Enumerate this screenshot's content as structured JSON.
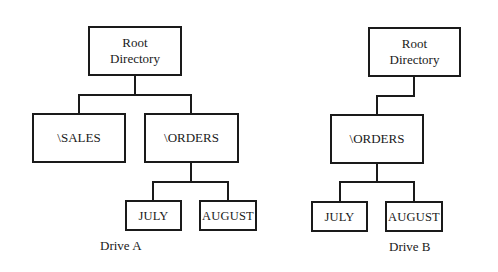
{
  "drive_a": {
    "caption": "Drive A",
    "root": "Root\nDirectory",
    "children": [
      {
        "label": "\\SALES"
      },
      {
        "label": "\\ORDERS",
        "children": [
          {
            "label": "JULY"
          },
          {
            "label": "AUGUST"
          }
        ]
      }
    ]
  },
  "drive_b": {
    "caption": "Drive B",
    "root": "Root\nDirectory",
    "children": [
      {
        "label": "\\ORDERS",
        "children": [
          {
            "label": "JULY"
          },
          {
            "label": "AUGUST"
          }
        ]
      }
    ]
  }
}
